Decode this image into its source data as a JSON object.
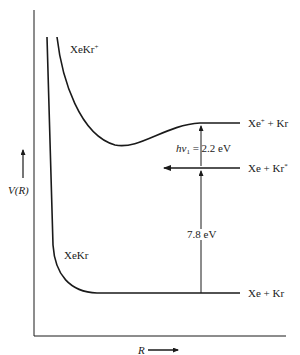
{
  "diagram": {
    "type": "potential-energy-curves",
    "axes": {
      "y_label": "V(R)",
      "x_label": "R"
    },
    "curves": [
      {
        "name": "XeKr+",
        "label_main": "XeKr",
        "label_sup": "+",
        "state": "ionic",
        "asymptote": "Xe+ + Kr"
      },
      {
        "name": "XeKr",
        "label_main": "XeKr",
        "label_sup": "",
        "state": "ground",
        "asymptote": "Xe + Kr"
      }
    ],
    "levels": {
      "upper": {
        "left": "Xe",
        "left_sup": "+",
        "right": " + Kr",
        "right_sup": ""
      },
      "middle": {
        "left": "Xe + Kr",
        "left_sup": "",
        "right": "",
        "right_sup": "*"
      },
      "lower": {
        "left": "Xe + Kr",
        "left_sup": "",
        "right": "",
        "right_sup": ""
      }
    },
    "annotations": {
      "photon": {
        "prefix": "h",
        "nu": "ν",
        "sub": "1",
        "suffix": " = 2.2 eV"
      },
      "gap": "7.8 eV"
    },
    "colors": {
      "line": "#1a1a1a",
      "background": "#ffffff"
    }
  }
}
